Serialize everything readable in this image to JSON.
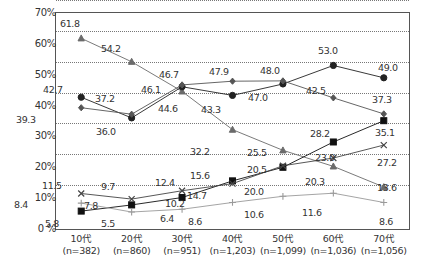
{
  "chart_data": {
    "type": "line",
    "title": "",
    "xlabel": "",
    "ylabel": "",
    "ylim": [
      0,
      70
    ],
    "grid": true,
    "legend_position": "none",
    "categories": [
      "10代",
      "20代",
      "30代",
      "40代",
      "50代",
      "60代",
      "70代"
    ],
    "sample_sizes": [
      "(n=382)",
      "(n=860)",
      "(n=951)",
      "(n=1,203)",
      "(n=1,099)",
      "(n=1,036)",
      "(n=1,056)"
    ],
    "ytick_labels": [
      "0 %",
      "10%",
      "20%",
      "30%",
      "40%",
      "50%",
      "60%",
      "70%"
    ],
    "ytick_values": [
      0,
      10,
      20,
      30,
      40,
      50,
      60,
      70
    ],
    "series": [
      {
        "name": "series-triangle",
        "marker": "triangle",
        "color": "#6b6b6b",
        "values": [
          61.8,
          54.2,
          44.6,
          32.2,
          25.5,
          20.3,
          13.6
        ],
        "labels": [
          "61.8",
          "54.2",
          "44.6",
          "32.2",
          "25.5",
          "20.3",
          "13.6"
        ]
      },
      {
        "name": "series-circle-filled",
        "marker": "circle",
        "color": "#222222",
        "values": [
          42.7,
          36.0,
          46.1,
          43.3,
          47.0,
          53.0,
          49.0
        ],
        "labels": [
          "42.7",
          "36.0",
          "46.1",
          "43.3",
          "47.0",
          "53.0",
          "49.0"
        ]
      },
      {
        "name": "series-diamond",
        "marker": "diamond",
        "color": "#555555",
        "values": [
          39.3,
          37.2,
          46.7,
          47.9,
          48.0,
          42.5,
          37.3
        ],
        "labels": [
          "39.3",
          "37.2",
          "46.7",
          "47.9",
          "48.0",
          "42.5",
          "37.3"
        ]
      },
      {
        "name": "series-square-filled",
        "marker": "square",
        "color": "#111111",
        "values": [
          5.8,
          7.8,
          10.2,
          15.6,
          20.0,
          28.2,
          35.1
        ],
        "labels": [
          "5.8",
          "7.8",
          "10.2",
          "15.6",
          "20.0",
          "28.2",
          "35.1"
        ]
      },
      {
        "name": "series-cross-x",
        "marker": "x",
        "color": "#444444",
        "values": [
          11.5,
          9.7,
          12.4,
          14.7,
          20.5,
          23.0,
          27.2
        ],
        "labels": [
          "11.5",
          "9.7",
          "12.4",
          "14.7",
          "20.5",
          "23.0",
          "27.2"
        ]
      },
      {
        "name": "series-plus",
        "marker": "plus",
        "color": "#9a9a9a",
        "values": [
          8.4,
          5.5,
          6.4,
          8.6,
          10.6,
          11.6,
          8.6
        ],
        "labels": [
          "8.4",
          "5.5",
          "6.4",
          "8.6",
          "10.6",
          "11.6",
          "8.6"
        ]
      }
    ],
    "annotations": [
      {
        "text": "61.8",
        "x": 60,
        "y": 18
      },
      {
        "text": "54.2",
        "x": 101,
        "y": 43
      },
      {
        "text": "46.7",
        "x": 159,
        "y": 69
      },
      {
        "text": "46.1",
        "x": 141,
        "y": 84
      },
      {
        "text": "44.6",
        "x": 158,
        "y": 103
      },
      {
        "text": "47.9",
        "x": 209,
        "y": 66
      },
      {
        "text": "43.3",
        "x": 201,
        "y": 104
      },
      {
        "text": "48.0",
        "x": 260,
        "y": 65
      },
      {
        "text": "47.0",
        "x": 248,
        "y": 92
      },
      {
        "text": "53.0",
        "x": 318,
        "y": 45
      },
      {
        "text": "42.5",
        "x": 306,
        "y": 85
      },
      {
        "text": "49.0",
        "x": 378,
        "y": 62
      },
      {
        "text": "37.3",
        "x": 372,
        "y": 94
      },
      {
        "text": "42.7",
        "x": 43,
        "y": 84
      },
      {
        "text": "39.3",
        "x": 16,
        "y": 114
      },
      {
        "text": "37.2",
        "x": 95,
        "y": 93
      },
      {
        "text": "36.0",
        "x": 96,
        "y": 126
      },
      {
        "text": "32.2",
        "x": 190,
        "y": 146
      },
      {
        "text": "25.5",
        "x": 247,
        "y": 147
      },
      {
        "text": "28.2",
        "x": 310,
        "y": 128
      },
      {
        "text": "23.0",
        "x": 315,
        "y": 152
      },
      {
        "text": "20.3",
        "x": 305,
        "y": 176
      },
      {
        "text": "35.1",
        "x": 375,
        "y": 127
      },
      {
        "text": "27.2",
        "x": 377,
        "y": 157
      },
      {
        "text": "13.6",
        "x": 377,
        "y": 182
      },
      {
        "text": "20.5",
        "x": 247,
        "y": 164
      },
      {
        "text": "20.0",
        "x": 244,
        "y": 186
      },
      {
        "text": "15.6",
        "x": 190,
        "y": 170
      },
      {
        "text": "14.7",
        "x": 187,
        "y": 190
      },
      {
        "text": "11.5",
        "x": 42,
        "y": 180
      },
      {
        "text": "9.7",
        "x": 101,
        "y": 181
      },
      {
        "text": "12.4",
        "x": 155,
        "y": 177
      },
      {
        "text": "10.2",
        "x": 165,
        "y": 198
      },
      {
        "text": "8.4",
        "x": 14,
        "y": 199
      },
      {
        "text": "7.8",
        "x": 84,
        "y": 200
      },
      {
        "text": "5.8",
        "x": 45,
        "y": 218
      },
      {
        "text": "5.5",
        "x": 101,
        "y": 218
      },
      {
        "text": "6.4",
        "x": 160,
        "y": 213
      },
      {
        "text": "8.6",
        "x": 188,
        "y": 216
      },
      {
        "text": "10.6",
        "x": 244,
        "y": 209
      },
      {
        "text": "11.6",
        "x": 302,
        "y": 207
      },
      {
        "text": "8.6",
        "x": 379,
        "y": 216
      }
    ]
  }
}
